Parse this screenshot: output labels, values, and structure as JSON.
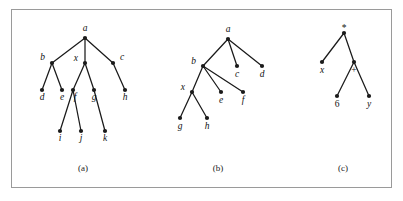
{
  "figure": {
    "background_color": "#ffffff",
    "border_color": "#9a9a9a",
    "node_color": "#1a1a1a",
    "edge_color": "#1a1a1a",
    "captions": [
      {
        "text": "(a)",
        "x": 83,
        "y": 171
      },
      {
        "text": "(b)",
        "x": 218,
        "y": 171
      },
      {
        "text": "(c)",
        "x": 343,
        "y": 171
      }
    ]
  },
  "trees": [
    {
      "id": "tree-a",
      "caption": "(a)",
      "nodes": [
        {
          "id": "a",
          "label": "a",
          "x": 85,
          "y": 38,
          "lx": 85,
          "ly": 31,
          "anchor": "middle",
          "style": "italic"
        },
        {
          "id": "b",
          "label": "b",
          "x": 52,
          "y": 63,
          "lx": 45,
          "ly": 60,
          "anchor": "end",
          "style": "italic"
        },
        {
          "id": "x",
          "label": "x",
          "x": 85,
          "y": 63,
          "lx": 78,
          "ly": 61,
          "anchor": "end",
          "style": "italic"
        },
        {
          "id": "c",
          "label": "c",
          "x": 113,
          "y": 63,
          "lx": 120,
          "ly": 60,
          "anchor": "start",
          "style": "italic"
        },
        {
          "id": "d",
          "label": "d",
          "x": 42,
          "y": 90,
          "lx": 42,
          "ly": 100,
          "anchor": "middle",
          "style": "italic"
        },
        {
          "id": "e",
          "label": "e",
          "x": 62,
          "y": 90,
          "lx": 62,
          "ly": 100,
          "anchor": "middle",
          "style": "italic"
        },
        {
          "id": "f",
          "label": "f",
          "x": 73,
          "y": 90,
          "lx": 75,
          "ly": 100,
          "anchor": "middle",
          "style": "italic"
        },
        {
          "id": "g",
          "label": "g",
          "x": 94,
          "y": 90,
          "lx": 94,
          "ly": 100,
          "anchor": "middle",
          "style": "italic"
        },
        {
          "id": "h",
          "label": "h",
          "x": 125,
          "y": 90,
          "lx": 125,
          "ly": 100,
          "anchor": "middle",
          "style": "italic"
        },
        {
          "id": "i",
          "label": "i",
          "x": 60,
          "y": 131,
          "lx": 60,
          "ly": 141,
          "anchor": "middle",
          "style": "italic"
        },
        {
          "id": "j",
          "label": "j",
          "x": 81,
          "y": 131,
          "lx": 81,
          "ly": 141,
          "anchor": "middle",
          "style": "italic"
        },
        {
          "id": "k",
          "label": "k",
          "x": 105,
          "y": 131,
          "lx": 105,
          "ly": 141,
          "anchor": "middle",
          "style": "italic"
        }
      ],
      "edges": [
        [
          "a",
          "b"
        ],
        [
          "a",
          "x"
        ],
        [
          "a",
          "c"
        ],
        [
          "b",
          "d"
        ],
        [
          "b",
          "e"
        ],
        [
          "x",
          "f"
        ],
        [
          "x",
          "g"
        ],
        [
          "c",
          "h"
        ],
        [
          "f",
          "i"
        ],
        [
          "f",
          "j"
        ],
        [
          "g",
          "k"
        ]
      ]
    },
    {
      "id": "tree-b",
      "caption": "(b)",
      "nodes": [
        {
          "id": "a",
          "label": "a",
          "x": 228,
          "y": 39,
          "lx": 228,
          "ly": 32,
          "anchor": "middle",
          "style": "italic"
        },
        {
          "id": "b",
          "label": "b",
          "x": 203,
          "y": 66,
          "lx": 196,
          "ly": 64,
          "anchor": "end",
          "style": "italic"
        },
        {
          "id": "c",
          "label": "c",
          "x": 237,
          "y": 66,
          "lx": 237,
          "ly": 77,
          "anchor": "middle",
          "style": "italic"
        },
        {
          "id": "d",
          "label": "d",
          "x": 262,
          "y": 66,
          "lx": 262,
          "ly": 77,
          "anchor": "middle",
          "style": "italic"
        },
        {
          "id": "x",
          "label": "x",
          "x": 192,
          "y": 92,
          "lx": 185,
          "ly": 90,
          "anchor": "end",
          "style": "italic"
        },
        {
          "id": "e",
          "label": "e",
          "x": 221,
          "y": 92,
          "lx": 221,
          "ly": 103,
          "anchor": "middle",
          "style": "italic"
        },
        {
          "id": "f",
          "label": "f",
          "x": 243,
          "y": 92,
          "lx": 243,
          "ly": 103,
          "anchor": "middle",
          "style": "italic"
        },
        {
          "id": "g",
          "label": "g",
          "x": 180,
          "y": 118,
          "lx": 180,
          "ly": 129,
          "anchor": "middle",
          "style": "italic"
        },
        {
          "id": "h",
          "label": "h",
          "x": 207,
          "y": 118,
          "lx": 207,
          "ly": 129,
          "anchor": "middle",
          "style": "italic"
        }
      ],
      "edges": [
        [
          "a",
          "b"
        ],
        [
          "a",
          "c"
        ],
        [
          "a",
          "d"
        ],
        [
          "b",
          "x"
        ],
        [
          "b",
          "e"
        ],
        [
          "b",
          "f"
        ],
        [
          "x",
          "g"
        ],
        [
          "x",
          "h"
        ]
      ]
    },
    {
      "id": "tree-c",
      "caption": "(c)",
      "nodes": [
        {
          "id": "mul",
          "label": "*",
          "x": 344,
          "y": 33,
          "lx": 344,
          "ly": 31,
          "anchor": "middle",
          "style": "upright"
        },
        {
          "id": "x",
          "label": "x",
          "x": 322,
          "y": 62,
          "lx": 322,
          "ly": 73,
          "anchor": "middle",
          "style": "italic"
        },
        {
          "id": "plus",
          "label": "+",
          "x": 354,
          "y": 62,
          "lx": 354,
          "ly": 73,
          "anchor": "middle",
          "style": "upright"
        },
        {
          "id": "six",
          "label": "6",
          "x": 337,
          "y": 96,
          "lx": 337,
          "ly": 107,
          "anchor": "middle",
          "style": "upright"
        },
        {
          "id": "y",
          "label": "y",
          "x": 369,
          "y": 96,
          "lx": 369,
          "ly": 107,
          "anchor": "middle",
          "style": "italic"
        }
      ],
      "edges": [
        [
          "mul",
          "x"
        ],
        [
          "mul",
          "plus"
        ],
        [
          "plus",
          "six"
        ],
        [
          "plus",
          "y"
        ]
      ]
    }
  ]
}
